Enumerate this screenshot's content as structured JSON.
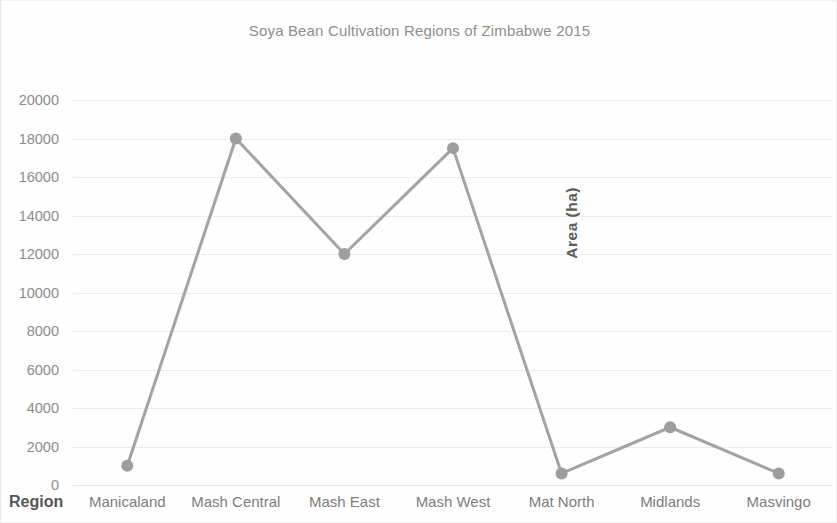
{
  "chart_data": {
    "type": "line",
    "title": "Soya Bean Cultivation Regions of Zimbabwe 2015",
    "xlabel": "Region",
    "ylabel": "Area (ha)",
    "categories": [
      "Manicaland",
      "Mash Central",
      "Mash East",
      "Mash West",
      "Mat North",
      "Midlands",
      "Masvingo"
    ],
    "values": [
      1000,
      18000,
      12000,
      17500,
      600,
      3000,
      600
    ],
    "series": [
      {
        "name": "Area (ha)",
        "values": [
          1000,
          18000,
          12000,
          17500,
          600,
          3000,
          600
        ]
      }
    ],
    "ylim": [
      0,
      20000
    ],
    "yticks": [
      0,
      2000,
      4000,
      6000,
      8000,
      10000,
      12000,
      14000,
      16000,
      18000,
      20000
    ],
    "ytick_labels": [
      "0",
      "2000",
      "4000",
      "6000",
      "8000",
      "10000",
      "12000",
      "14000",
      "16000",
      "18000",
      "20000"
    ],
    "grid": true,
    "grid_axis": "y",
    "legend": false,
    "legend_position": "none",
    "marker": "circle",
    "colors": {
      "line": "#a3a3a3",
      "marker": "#9d9d9d",
      "gridline": "#ececec",
      "title_text": "#8e8e8e",
      "tick_text": "#8c8c8c",
      "axis_title_text": "#565656",
      "background": "#fefefe"
    }
  }
}
